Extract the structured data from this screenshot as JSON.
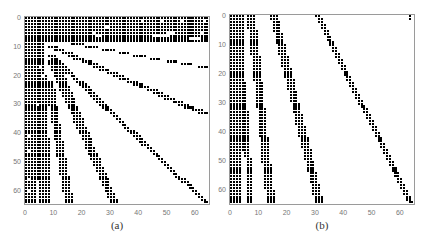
{
  "chart_data": [
    {
      "type": "heatmap",
      "subtype": "sparsity-pattern",
      "caption": "(a)",
      "xlabel": "",
      "ylabel": "",
      "grid_size": 65,
      "xlim": [
        0,
        64
      ],
      "ylim": [
        64,
        0
      ],
      "x_ticks": [
        0,
        10,
        20,
        30,
        40,
        50,
        60
      ],
      "y_ticks": [
        0,
        10,
        20,
        30,
        40,
        50,
        60
      ],
      "grid": false,
      "frame": {
        "left": 24,
        "top": 16,
        "width": 186,
        "height": 189
      },
      "bands": [
        {
          "name": "top-block",
          "rows": [
            0,
            8
          ],
          "col_start": [
            0,
            0
          ],
          "col_end": [
            64,
            64
          ]
        },
        {
          "name": "left-block",
          "rows": [
            0,
            64
          ],
          "col_start": [
            0,
            0
          ],
          "col_end": [
            7,
            3
          ]
        },
        {
          "name": "left-strip",
          "rows": [
            20,
            64
          ],
          "col_start": [
            5,
            5
          ],
          "col_end": [
            7,
            8
          ]
        },
        {
          "name": "band-a",
          "rows": [
            8,
            17
          ],
          "col_start": [
            10,
            61
          ],
          "col_end": [
            14,
            64
          ]
        },
        {
          "name": "band-b",
          "rows": [
            10,
            33
          ],
          "col_start": [
            8,
            61
          ],
          "col_end": [
            11,
            64
          ]
        },
        {
          "name": "band-c",
          "rows": [
            13,
            64
          ],
          "col_start": [
            8,
            63
          ],
          "col_end": [
            10,
            64
          ]
        },
        {
          "name": "band-d",
          "rows": [
            15,
            64
          ],
          "col_start": [
            8,
            30
          ],
          "col_end": [
            11,
            32
          ]
        },
        {
          "name": "band-e",
          "rows": [
            22,
            64
          ],
          "col_start": [
            7,
            14
          ],
          "col_end": [
            9,
            16
          ]
        }
      ],
      "holes": [
        [
          1,
          48
        ],
        [
          1,
          55
        ],
        [
          1,
          41
        ],
        [
          1,
          63
        ],
        [
          5,
          24
        ],
        [
          5,
          62
        ],
        [
          5,
          50
        ],
        [
          5,
          51
        ],
        [
          5,
          52
        ],
        [
          6,
          25
        ],
        [
          6,
          26
        ],
        [
          6,
          45
        ],
        [
          6,
          46
        ],
        [
          6,
          47
        ],
        [
          6,
          48
        ],
        [
          6,
          49
        ],
        [
          6,
          50
        ],
        [
          7,
          58
        ],
        [
          7,
          59
        ],
        [
          7,
          60
        ],
        [
          7,
          61
        ],
        [
          3,
          28
        ],
        [
          3,
          29
        ],
        [
          17,
          5
        ],
        [
          20,
          6
        ],
        [
          30,
          4
        ],
        [
          41,
          1
        ],
        [
          46,
          1
        ],
        [
          56,
          1
        ],
        [
          60,
          1
        ]
      ]
    },
    {
      "type": "heatmap",
      "subtype": "sparsity-pattern",
      "caption": "(b)",
      "xlabel": "",
      "ylabel": "",
      "grid_size": 65,
      "xlim": [
        0,
        64
      ],
      "ylim": [
        64,
        0
      ],
      "x_ticks": [
        0,
        10,
        20,
        30,
        40,
        50,
        60
      ],
      "y_ticks": [
        0,
        10,
        20,
        30,
        40,
        50,
        60
      ],
      "grid": false,
      "frame": {
        "left": 229,
        "top": 14,
        "width": 186,
        "height": 191
      },
      "bands": [
        {
          "name": "band-1",
          "rows": [
            0,
            46
          ],
          "col_start": [
            0,
            0
          ],
          "col_end": [
            4,
            5
          ]
        },
        {
          "name": "band-1-lower",
          "rows": [
            47,
            64
          ],
          "col_start": [
            0,
            0
          ],
          "col_end": [
            3,
            3
          ]
        },
        {
          "name": "band-1-side",
          "rows": [
            33,
            64
          ],
          "col_start": [
            5,
            6
          ],
          "col_end": [
            6,
            7
          ]
        },
        {
          "name": "band-2",
          "rows": [
            0,
            64
          ],
          "col_start": [
            6,
            13
          ],
          "col_end": [
            8,
            15
          ]
        },
        {
          "name": "band-3",
          "rows": [
            0,
            64
          ],
          "col_start": [
            14,
            30
          ],
          "col_end": [
            16,
            32
          ]
        },
        {
          "name": "band-4",
          "rows": [
            0,
            64
          ],
          "col_start": [
            30,
            63
          ],
          "col_end": [
            31,
            64
          ]
        },
        {
          "name": "isolated",
          "rows": [
            0,
            1
          ],
          "col_start": [
            63,
            63
          ],
          "col_end": [
            63,
            63
          ]
        }
      ],
      "holes": []
    }
  ]
}
